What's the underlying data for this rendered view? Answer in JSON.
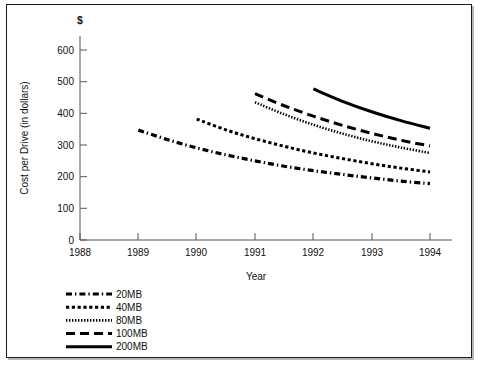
{
  "chart_data": {
    "type": "line",
    "title": "",
    "xlabel": "Year",
    "ylabel": "Cost per Drive (in dollars)",
    "y_unit_symbol": "$",
    "xlim": [
      1988,
      1994
    ],
    "ylim": [
      0,
      650
    ],
    "x_ticks": [
      "1988",
      "1989",
      "1990",
      "1991",
      "1992",
      "1993",
      "1994"
    ],
    "y_ticks": [
      "0",
      "100",
      "200",
      "300",
      "400",
      "500",
      "600"
    ],
    "grid": false,
    "legend_position": "below-left",
    "series": [
      {
        "name": "20MB",
        "style": "dash-dot",
        "x": [
          1989,
          1989.5,
          1990,
          1990.5,
          1991,
          1991.5,
          1992,
          1992.5,
          1993,
          1993.5,
          1994
        ],
        "values": [
          347,
          317,
          291,
          269,
          250,
          233,
          219,
          207,
          196,
          186,
          178
        ]
      },
      {
        "name": "40MB",
        "style": "dashed-short",
        "x": [
          1990,
          1990.5,
          1991,
          1991.5,
          1992,
          1992.5,
          1993,
          1993.5,
          1994
        ],
        "values": [
          382,
          348,
          320,
          296,
          275,
          257,
          241,
          227,
          215
        ]
      },
      {
        "name": "80MB",
        "style": "dotted",
        "x": [
          1991,
          1991.5,
          1992,
          1992.5,
          1993,
          1993.5,
          1994
        ],
        "values": [
          435,
          397,
          364,
          336,
          312,
          292,
          275
        ]
      },
      {
        "name": "100MB",
        "style": "dashed-long",
        "x": [
          1991,
          1991.5,
          1992,
          1992.5,
          1993,
          1993.5,
          1994
        ],
        "values": [
          462,
          424,
          391,
          362,
          337,
          315,
          297
        ]
      },
      {
        "name": "200MB",
        "style": "solid",
        "x": [
          1992,
          1992.5,
          1993,
          1993.5,
          1994
        ],
        "values": [
          477,
          438,
          405,
          377,
          353
        ]
      }
    ]
  },
  "legend": {
    "items": [
      {
        "label": "20MB"
      },
      {
        "label": "40MB"
      },
      {
        "label": "80MB"
      },
      {
        "label": "100MB"
      },
      {
        "label": "200MB"
      }
    ]
  }
}
